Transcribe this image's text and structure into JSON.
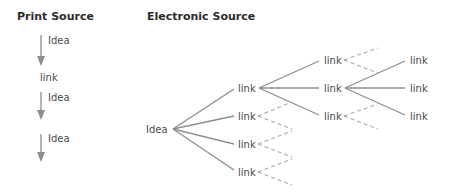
{
  "headings": {
    "print": "Print Source",
    "electronic": "Electronic Source"
  },
  "print_source": {
    "items": [
      {
        "type": "arrow",
        "label": "Idea"
      },
      {
        "type": "node",
        "label": "link"
      },
      {
        "type": "arrow",
        "label": "Idea"
      },
      {
        "type": "arrow",
        "label": "Idea"
      }
    ]
  },
  "electronic_source": {
    "root": "Idea",
    "level1": [
      "link",
      "link",
      "link",
      "link"
    ],
    "level2": [
      "link",
      "link",
      "link"
    ],
    "level3": [
      "link",
      "link",
      "link"
    ],
    "notes": "Root 'Idea' fans to 4 links; first link fans to 3 links (solid); middle level-2 link fans to 3 links (solid); other links have dashed continuation branches."
  }
}
